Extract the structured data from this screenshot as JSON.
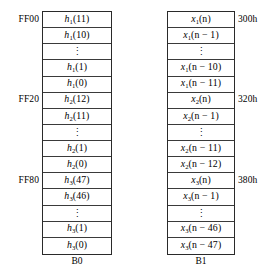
{
  "figure": {
    "banks": [
      {
        "id": "b0",
        "caption": "B0",
        "addresses": [
          {
            "label": "FF00",
            "row": 0
          },
          {
            "label": "FF20",
            "row": 5
          },
          {
            "label": "FF80",
            "row": 10
          }
        ],
        "cells": [
          {
            "text": "h1(11)",
            "base": "h",
            "sub": "1",
            "arg": "(11)",
            "kind": "value"
          },
          {
            "text": "h1(10)",
            "base": "h",
            "sub": "1",
            "arg": "(10)",
            "kind": "value"
          },
          {
            "text": "⋮",
            "kind": "ellipsis"
          },
          {
            "text": "h1(1)",
            "base": "h",
            "sub": "1",
            "arg": "(1)",
            "kind": "value"
          },
          {
            "text": "h1(0)",
            "base": "h",
            "sub": "1",
            "arg": "(0)",
            "kind": "value"
          },
          {
            "text": "h2(12)",
            "base": "h",
            "sub": "2",
            "arg": "(12)",
            "kind": "value"
          },
          {
            "text": "h2(11)",
            "base": "h",
            "sub": "2",
            "arg": "(11)",
            "kind": "value"
          },
          {
            "text": "⋮",
            "kind": "ellipsis"
          },
          {
            "text": "h2(1)",
            "base": "h",
            "sub": "2",
            "arg": "(1)",
            "kind": "value"
          },
          {
            "text": "h2(0)",
            "base": "h",
            "sub": "2",
            "arg": "(0)",
            "kind": "value"
          },
          {
            "text": "h3(47)",
            "base": "h",
            "sub": "3",
            "arg": "(47)",
            "kind": "value"
          },
          {
            "text": "h3(46)",
            "base": "h",
            "sub": "3",
            "arg": "(46)",
            "kind": "value"
          },
          {
            "text": "⋮",
            "kind": "ellipsis"
          },
          {
            "text": "h3(1)",
            "base": "h",
            "sub": "3",
            "arg": "(1)",
            "kind": "value"
          },
          {
            "text": "h3(0)",
            "base": "h",
            "sub": "3",
            "arg": "(0)",
            "kind": "value"
          }
        ]
      },
      {
        "id": "b1",
        "caption": "B1",
        "addresses": [
          {
            "label": "300h",
            "row": 0
          },
          {
            "label": "320h",
            "row": 5
          },
          {
            "label": "380h",
            "row": 10
          }
        ],
        "cells": [
          {
            "text": "x1(n)",
            "base": "x",
            "sub": "1",
            "arg": "(n)",
            "kind": "value"
          },
          {
            "text": "x1(n − 1)",
            "base": "x",
            "sub": "1",
            "arg": "(n − 1)",
            "kind": "value"
          },
          {
            "text": "⋮",
            "kind": "ellipsis"
          },
          {
            "text": "x1(n − 10)",
            "base": "x",
            "sub": "1",
            "arg": "(n − 10)",
            "kind": "value"
          },
          {
            "text": "x1(n − 11)",
            "base": "x",
            "sub": "1",
            "arg": "(n − 11)",
            "kind": "value"
          },
          {
            "text": "x2(n)",
            "base": "x",
            "sub": "2",
            "arg": "(n)",
            "kind": "value"
          },
          {
            "text": "x2(n − 1)",
            "base": "x",
            "sub": "2",
            "arg": "(n − 1)",
            "kind": "value"
          },
          {
            "text": "⋮",
            "kind": "ellipsis"
          },
          {
            "text": "x2(n − 11)",
            "base": "x",
            "sub": "2",
            "arg": "(n − 11)",
            "kind": "value"
          },
          {
            "text": "x2(n − 12)",
            "base": "x",
            "sub": "2",
            "arg": "(n − 12)",
            "kind": "value"
          },
          {
            "text": "x3(n)",
            "base": "x",
            "sub": "3",
            "arg": "(n)",
            "kind": "value"
          },
          {
            "text": "x3(n − 1)",
            "base": "x",
            "sub": "3",
            "arg": "(n − 1)",
            "kind": "value"
          },
          {
            "text": "⋮",
            "kind": "ellipsis"
          },
          {
            "text": "x3(n − 46)",
            "base": "x",
            "sub": "3",
            "arg": "(n − 46)",
            "kind": "value"
          },
          {
            "text": "x3(n − 47)",
            "base": "x",
            "sub": "3",
            "arg": "(n − 47)",
            "kind": "value"
          }
        ]
      }
    ],
    "layout": {
      "row_height": 16.13,
      "table_top": 11,
      "rows": 15
    },
    "colors": {
      "border": "#2a2a2a",
      "separator": "#3a3a3a",
      "background": "#ffffff",
      "text": "#000000"
    }
  }
}
